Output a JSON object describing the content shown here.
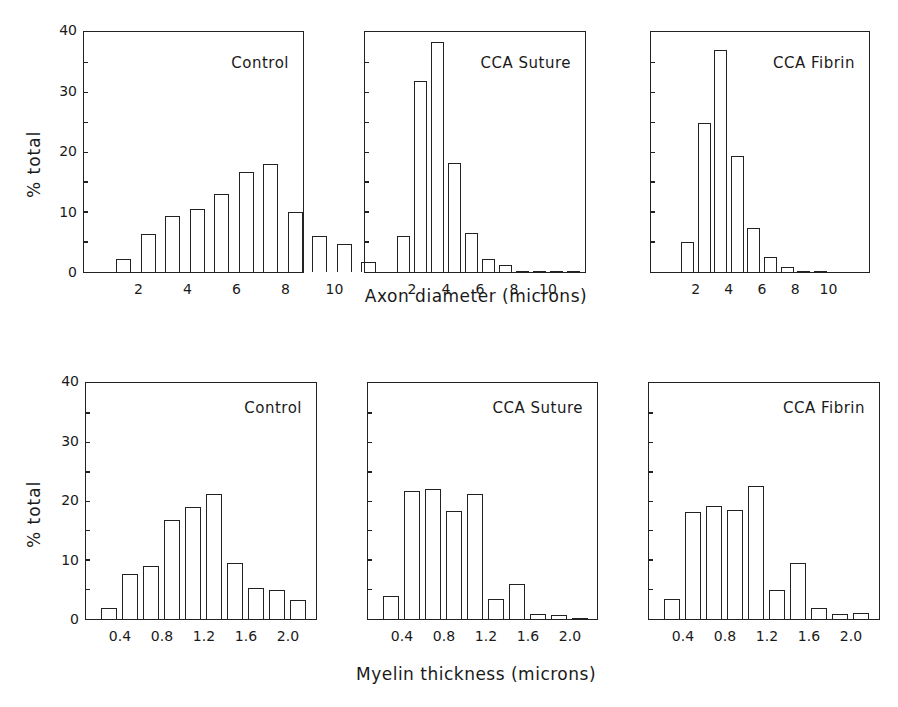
{
  "chart_data": [
    {
      "type": "bar",
      "row": "top",
      "title": "Control",
      "xlabel": "Axon diameter (microns)",
      "ylabel": "% total",
      "ylim": [
        0,
        40
      ],
      "yticks": [
        0,
        10,
        20,
        30,
        40
      ],
      "xticks": [
        "2",
        "4",
        "6",
        "8",
        "10"
      ],
      "categories": [
        "1-2",
        "2-3",
        "3-4",
        "4-5",
        "5-6",
        "6-7",
        "7-8",
        "8-9",
        "9-10",
        "10-11",
        "11-12"
      ],
      "values": [
        2.2,
        6.4,
        9.3,
        10.5,
        13,
        16.8,
        18,
        10,
        6,
        4.7,
        1.6
      ]
    },
    {
      "type": "bar",
      "row": "top",
      "title": "CCA Suture",
      "xlabel": "Axon diameter (microns)",
      "ylabel": "% total",
      "ylim": [
        0,
        40
      ],
      "xticks": [
        "2",
        "4",
        "6",
        "8",
        "10"
      ],
      "categories": [
        "1-2",
        "2-3",
        "3-4",
        "4-5",
        "5-6",
        "6-7",
        "7-8",
        "8-9",
        "9-10",
        "10-11",
        "11-12"
      ],
      "values": [
        6,
        32,
        38.5,
        18.2,
        6.5,
        2.2,
        1.2,
        0.1,
        0.3,
        0,
        0.1
      ]
    },
    {
      "type": "bar",
      "row": "top",
      "title": "CCA Fibrin",
      "xlabel": "Axon diameter (microns)",
      "ylabel": "% total",
      "ylim": [
        0,
        40
      ],
      "xticks": [
        "2",
        "4",
        "6",
        "8",
        "10"
      ],
      "categories": [
        "1-2",
        "2-3",
        "3-4",
        "4-5",
        "5-6",
        "6-7",
        "7-8",
        "8-9",
        "9-10"
      ],
      "values": [
        5,
        25,
        37.2,
        19.4,
        7.3,
        2.5,
        0.9,
        0.4,
        0.1
      ]
    },
    {
      "type": "bar",
      "row": "bottom",
      "title": "Control",
      "xlabel": "Myelin thickness (microns)",
      "ylabel": "% total",
      "ylim": [
        0,
        40
      ],
      "yticks": [
        0,
        10,
        20,
        30,
        40
      ],
      "xticks": [
        "0.4",
        "0.8",
        "1.2",
        "1.6",
        "2.0"
      ],
      "categories": [
        "0.2-0.4",
        "0.4-0.6",
        "0.6-0.8",
        "0.8-1.0",
        "1.0-1.2",
        "1.2-1.4",
        "1.4-1.6",
        "1.6-1.8",
        "1.8-2.0",
        "2.0-2.2"
      ],
      "values": [
        1.8,
        7.7,
        9.1,
        16.9,
        19,
        21.2,
        9.5,
        5.2,
        4.9,
        3.3
      ]
    },
    {
      "type": "bar",
      "row": "bottom",
      "title": "CCA Suture",
      "xlabel": "Myelin thickness (microns)",
      "ylabel": "% total",
      "ylim": [
        0,
        40
      ],
      "xticks": [
        "0.4",
        "0.8",
        "1.2",
        "1.6",
        "2.0"
      ],
      "categories": [
        "0.2-0.4",
        "0.4-0.6",
        "0.6-0.8",
        "0.8-1.0",
        "1.0-1.2",
        "1.2-1.4",
        "1.4-1.6",
        "1.6-1.8",
        "1.8-2.0",
        "2.0-2.2"
      ],
      "values": [
        4,
        21.8,
        22.1,
        18.4,
        21.3,
        3.4,
        6,
        0.8,
        0.6,
        0.2
      ]
    },
    {
      "type": "bar",
      "row": "bottom",
      "title": "CCA Fibrin",
      "xlabel": "Myelin thickness (microns)",
      "ylabel": "% total",
      "ylim": [
        0,
        40
      ],
      "xticks": [
        "0.4",
        "0.8",
        "1.2",
        "1.6",
        "2.0"
      ],
      "categories": [
        "0.2-0.4",
        "0.4-0.6",
        "0.6-0.8",
        "0.8-1.0",
        "1.0-1.2",
        "1.2-1.4",
        "1.4-1.6",
        "1.6-1.8",
        "1.8-2.0",
        "2.0-2.2"
      ],
      "values": [
        3.4,
        18.3,
        19.2,
        18.6,
        22.6,
        4.9,
        9.5,
        1.8,
        0.9,
        1.1
      ]
    }
  ],
  "labels": {
    "ylabel": "% total",
    "top_xlabel": "Axon diameter (microns)",
    "bottom_xlabel": "Myelin thickness (microns)",
    "yticks": [
      "0",
      "10",
      "20",
      "30",
      "40"
    ]
  }
}
